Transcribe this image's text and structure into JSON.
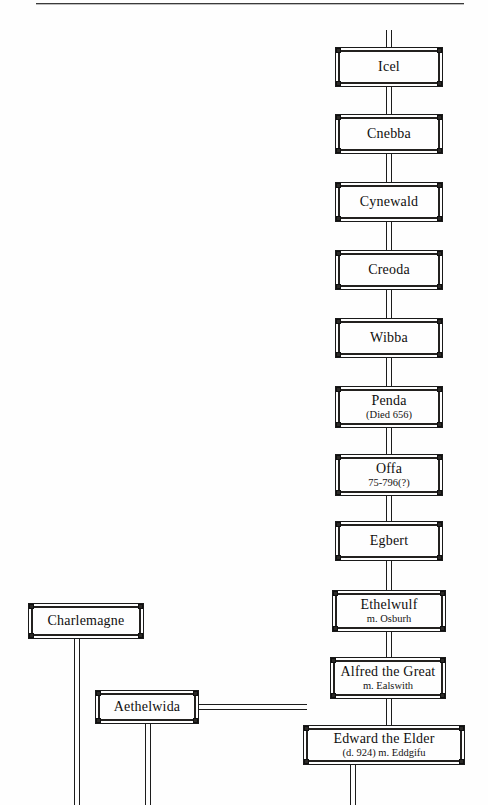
{
  "page": {
    "background_color": "#fefefe",
    "ink_color": "#1a1a1a",
    "width": 488,
    "height": 805
  },
  "header_rule": {
    "name": "top-horizontal-rule",
    "x": 36,
    "y": 3,
    "width": 428
  },
  "chart_data": {
    "type": "diagram",
    "subtype": "genealogy-tree",
    "title": "",
    "nodes": [
      {
        "id": "icel",
        "label": "Icel",
        "sub": "",
        "x": 335,
        "y": 47,
        "w": 108,
        "h": 40
      },
      {
        "id": "cnebba",
        "label": "Cnebba",
        "sub": "",
        "x": 335,
        "y": 114,
        "w": 108,
        "h": 40
      },
      {
        "id": "cynewald",
        "label": "Cynewald",
        "sub": "",
        "x": 335,
        "y": 182,
        "w": 108,
        "h": 40
      },
      {
        "id": "creoda",
        "label": "Creoda",
        "sub": "",
        "x": 335,
        "y": 250,
        "w": 108,
        "h": 40
      },
      {
        "id": "wibba",
        "label": "Wibba",
        "sub": "",
        "x": 335,
        "y": 318,
        "w": 108,
        "h": 40
      },
      {
        "id": "penda",
        "label": "Penda",
        "sub": "(Died 656)",
        "x": 335,
        "y": 386,
        "w": 108,
        "h": 42
      },
      {
        "id": "offa",
        "label": "Offa",
        "sub": "75-796(?)",
        "x": 335,
        "y": 454,
        "w": 108,
        "h": 42
      },
      {
        "id": "egbert",
        "label": "Egbert",
        "sub": "",
        "x": 335,
        "y": 521,
        "w": 108,
        "h": 40
      },
      {
        "id": "ethelwulf",
        "label": "Ethelwulf",
        "sub": "m. Osburh",
        "x": 332,
        "y": 590,
        "w": 114,
        "h": 42
      },
      {
        "id": "alfred",
        "label": "Alfred the Great",
        "sub": "m. Ealswith",
        "x": 330,
        "y": 657,
        "w": 116,
        "h": 42
      },
      {
        "id": "charlemagne",
        "label": "Charlemagne",
        "sub": "",
        "x": 28,
        "y": 603,
        "w": 116,
        "h": 36
      },
      {
        "id": "aethelwida",
        "label": "Aethelwida",
        "sub": "",
        "x": 95,
        "y": 690,
        "w": 104,
        "h": 34
      },
      {
        "id": "edward",
        "label": "Edward the Elder",
        "sub": "(d. 924)  m. Eddgifu",
        "x": 303,
        "y": 725,
        "w": 162,
        "h": 40
      }
    ],
    "edges": [
      {
        "from": "",
        "to": "icel",
        "orientation": "vertical",
        "note": "stub above Icel"
      },
      {
        "from": "icel",
        "to": "cnebba",
        "orientation": "vertical"
      },
      {
        "from": "cnebba",
        "to": "cynewald",
        "orientation": "vertical"
      },
      {
        "from": "cynewald",
        "to": "creoda",
        "orientation": "vertical"
      },
      {
        "from": "creoda",
        "to": "wibba",
        "orientation": "vertical"
      },
      {
        "from": "wibba",
        "to": "penda",
        "orientation": "vertical"
      },
      {
        "from": "penda",
        "to": "offa",
        "orientation": "vertical"
      },
      {
        "from": "offa",
        "to": "egbert",
        "orientation": "vertical"
      },
      {
        "from": "egbert",
        "to": "ethelwulf",
        "orientation": "vertical"
      },
      {
        "from": "ethelwulf",
        "to": "alfred",
        "orientation": "vertical"
      },
      {
        "from": "alfred",
        "to": "edward",
        "orientation": "vertical"
      },
      {
        "from": "aethelwida",
        "to": "edward",
        "orientation": "horizontal"
      },
      {
        "from": "charlemagne",
        "to": "",
        "orientation": "vertical",
        "note": "descends past bottom edge"
      },
      {
        "from": "aethelwida",
        "to": "",
        "orientation": "vertical",
        "note": "descends past bottom edge"
      },
      {
        "from": "edward",
        "to": "",
        "orientation": "vertical",
        "note": "descends past bottom edge"
      }
    ]
  }
}
